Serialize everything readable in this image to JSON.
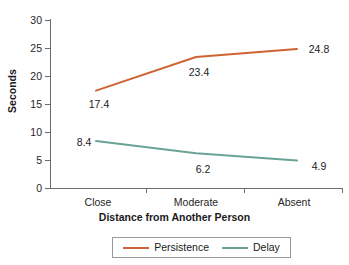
{
  "chart_data": {
    "type": "line",
    "title": "",
    "xlabel": "Distance from Another Person",
    "ylabel": "Seconds",
    "categories": [
      "Close",
      "Moderate",
      "Absent"
    ],
    "ylim": [
      0,
      30
    ],
    "yticks": [
      0,
      5,
      10,
      15,
      20,
      25,
      30
    ],
    "ytick_labels": [
      "0",
      "5",
      "10",
      "15",
      "20",
      "25",
      "30"
    ],
    "grid": false,
    "legend_position": "bottom-center",
    "series": [
      {
        "name": "Persistence",
        "color": "#CE6434",
        "values": [
          17.4,
          23.4,
          24.8
        ],
        "value_labels": [
          "17.4",
          "23.4",
          "24.8"
        ]
      },
      {
        "name": "Delay",
        "color": "#6AA296",
        "values": [
          8.4,
          6.2,
          4.9
        ],
        "value_labels": [
          "8.4",
          "6.2",
          "4.9"
        ]
      }
    ]
  },
  "axes": {
    "y_title": "Seconds",
    "x_title": "Distance from Another Person",
    "y_tick_labels": [
      "30",
      "25",
      "20",
      "15",
      "10",
      "5",
      "0"
    ],
    "x_tick_labels": [
      "Close",
      "Moderate",
      "Absent"
    ]
  },
  "legend": {
    "entries": [
      {
        "label": "Persistence",
        "color": "#CE6434"
      },
      {
        "label": "Delay",
        "color": "#6AA296"
      }
    ]
  },
  "labels": {
    "persistence": {
      "close": "17.4",
      "moderate": "23.4",
      "absent": "24.8"
    },
    "delay": {
      "close": "8.4",
      "moderate": "6.2",
      "absent": "4.9"
    }
  },
  "colors": {
    "persistence": "#CE6434",
    "delay": "#6AA296",
    "axis": "#6d6d6d",
    "text": "#1a1a1a",
    "background": "#ffffff"
  }
}
